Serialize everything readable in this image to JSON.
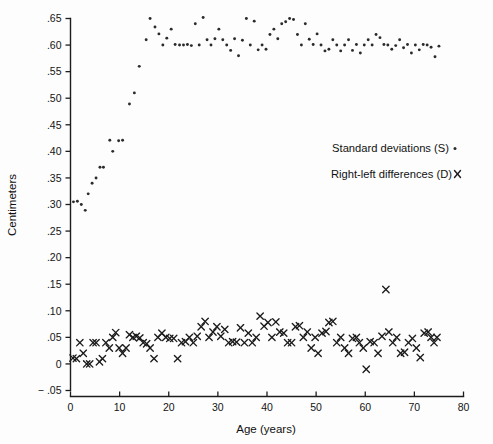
{
  "chart_data": {
    "type": "scatter",
    "title": "",
    "xlabel": "Age (years)",
    "ylabel": "Centimeters",
    "xlim": [
      0,
      80
    ],
    "ylim": [
      -0.05,
      0.65
    ],
    "xticks": [
      0,
      10,
      20,
      30,
      40,
      50,
      60,
      70,
      80
    ],
    "xtick_labels": [
      "0",
      "10",
      "20",
      "30",
      "40",
      "50",
      "60",
      "70",
      "80"
    ],
    "yticks": [
      -0.05,
      0,
      0.05,
      0.1,
      0.15,
      0.2,
      0.25,
      0.3,
      0.35,
      0.4,
      0.45,
      0.5,
      0.55,
      0.6,
      0.65
    ],
    "ytick_labels": [
      "− .05",
      "0",
      ".05",
      ".10",
      ".15",
      ".20",
      ".25",
      ".30",
      ".35",
      ".40",
      ".45",
      ".50",
      ".55",
      ".60",
      ".65"
    ],
    "grid": false,
    "legend_position": "center-right",
    "legend": [
      {
        "label": "Standard deviations (S)",
        "marker": "dot",
        "series": "S"
      },
      {
        "label": "Right-left differences (D)",
        "marker": "x",
        "series": "D"
      }
    ],
    "series": [
      {
        "name": "Standard deviations (S)",
        "key": "S",
        "marker": "dot",
        "color": "#2b2b2b",
        "points": [
          [
            0.6,
            0.305
          ],
          [
            1.4,
            0.306
          ],
          [
            2.2,
            0.3
          ],
          [
            3.0,
            0.289
          ],
          [
            3.6,
            0.32
          ],
          [
            4.4,
            0.34
          ],
          [
            5.2,
            0.35
          ],
          [
            6.0,
            0.37
          ],
          [
            6.7,
            0.37
          ],
          [
            8.0,
            0.421
          ],
          [
            8.6,
            0.4
          ],
          [
            9.8,
            0.42
          ],
          [
            10.6,
            0.421
          ],
          [
            12.0,
            0.489
          ],
          [
            13.0,
            0.51
          ],
          [
            14.0,
            0.56
          ],
          [
            15.4,
            0.61
          ],
          [
            16.2,
            0.65
          ],
          [
            17.2,
            0.634
          ],
          [
            18.0,
            0.621
          ],
          [
            18.8,
            0.6
          ],
          [
            19.6,
            0.613
          ],
          [
            20.5,
            0.63
          ],
          [
            21.3,
            0.601
          ],
          [
            22.2,
            0.6
          ],
          [
            23.0,
            0.6
          ],
          [
            23.8,
            0.601
          ],
          [
            24.6,
            0.599
          ],
          [
            25.4,
            0.64
          ],
          [
            26.2,
            0.6
          ],
          [
            27.0,
            0.652
          ],
          [
            27.8,
            0.61
          ],
          [
            28.6,
            0.6
          ],
          [
            29.4,
            0.612
          ],
          [
            30.2,
            0.63
          ],
          [
            31.0,
            0.61
          ],
          [
            31.8,
            0.6
          ],
          [
            32.6,
            0.59
          ],
          [
            33.4,
            0.612
          ],
          [
            34.2,
            0.58
          ],
          [
            35.0,
            0.609
          ],
          [
            35.8,
            0.65
          ],
          [
            36.6,
            0.6
          ],
          [
            37.4,
            0.645
          ],
          [
            38.2,
            0.591
          ],
          [
            39.0,
            0.6
          ],
          [
            39.8,
            0.592
          ],
          [
            40.6,
            0.62
          ],
          [
            41.4,
            0.63
          ],
          [
            42.2,
            0.612
          ],
          [
            43.0,
            0.64
          ],
          [
            43.8,
            0.644
          ],
          [
            44.6,
            0.65
          ],
          [
            45.4,
            0.648
          ],
          [
            46.2,
            0.62
          ],
          [
            47.0,
            0.6
          ],
          [
            47.8,
            0.64
          ],
          [
            48.6,
            0.611
          ],
          [
            49.4,
            0.601
          ],
          [
            50.2,
            0.621
          ],
          [
            51.0,
            0.6
          ],
          [
            51.8,
            0.589
          ],
          [
            52.6,
            0.592
          ],
          [
            53.4,
            0.61
          ],
          [
            54.2,
            0.6
          ],
          [
            55.0,
            0.589
          ],
          [
            55.8,
            0.6
          ],
          [
            56.6,
            0.61
          ],
          [
            57.4,
            0.59
          ],
          [
            58.2,
            0.601
          ],
          [
            59.0,
            0.585
          ],
          [
            59.8,
            0.6
          ],
          [
            60.6,
            0.61
          ],
          [
            61.4,
            0.6
          ],
          [
            62.2,
            0.62
          ],
          [
            63.0,
            0.614
          ],
          [
            63.8,
            0.601
          ],
          [
            64.6,
            0.6
          ],
          [
            65.4,
            0.592
          ],
          [
            66.2,
            0.599
          ],
          [
            67.0,
            0.61
          ],
          [
            67.8,
            0.595
          ],
          [
            68.6,
            0.601
          ],
          [
            69.4,
            0.585
          ],
          [
            70.2,
            0.6
          ],
          [
            71.0,
            0.591
          ],
          [
            71.8,
            0.601
          ],
          [
            72.6,
            0.6
          ],
          [
            73.4,
            0.596
          ],
          [
            74.2,
            0.578
          ],
          [
            75.0,
            0.598
          ]
        ]
      },
      {
        "name": "Right-left differences (D)",
        "key": "D",
        "marker": "x",
        "color": "#1b1b1b",
        "points": [
          [
            0.5,
            0.011
          ],
          [
            1.2,
            0.01
          ],
          [
            1.9,
            0.04
          ],
          [
            2.6,
            0.02
          ],
          [
            3.3,
            0.0
          ],
          [
            3.9,
            0.0
          ],
          [
            4.6,
            0.04
          ],
          [
            5.2,
            0.04
          ],
          [
            5.9,
            0.004
          ],
          [
            6.5,
            0.01
          ],
          [
            7.2,
            0.04
          ],
          [
            7.9,
            0.03
          ],
          [
            8.6,
            0.05
          ],
          [
            9.2,
            0.059
          ],
          [
            9.9,
            0.03
          ],
          [
            10.6,
            0.02
          ],
          [
            11.3,
            0.03
          ],
          [
            12.0,
            0.055
          ],
          [
            12.7,
            0.05
          ],
          [
            13.4,
            0.052
          ],
          [
            14.1,
            0.049
          ],
          [
            14.8,
            0.04
          ],
          [
            15.5,
            0.038
          ],
          [
            16.2,
            0.03
          ],
          [
            17.0,
            0.01
          ],
          [
            17.8,
            0.05
          ],
          [
            18.6,
            0.058
          ],
          [
            19.4,
            0.05
          ],
          [
            20.2,
            0.048
          ],
          [
            21.0,
            0.048
          ],
          [
            21.8,
            0.01
          ],
          [
            22.6,
            0.04
          ],
          [
            23.4,
            0.042
          ],
          [
            24.2,
            0.05
          ],
          [
            25.0,
            0.04
          ],
          [
            25.8,
            0.052
          ],
          [
            26.6,
            0.07
          ],
          [
            27.4,
            0.08
          ],
          [
            28.2,
            0.05
          ],
          [
            29.0,
            0.06
          ],
          [
            29.8,
            0.07
          ],
          [
            30.6,
            0.052
          ],
          [
            31.4,
            0.065
          ],
          [
            32.2,
            0.04
          ],
          [
            33.0,
            0.042
          ],
          [
            33.8,
            0.041
          ],
          [
            34.6,
            0.068
          ],
          [
            35.4,
            0.04
          ],
          [
            36.2,
            0.058
          ],
          [
            37.0,
            0.04
          ],
          [
            37.8,
            0.05
          ],
          [
            38.6,
            0.09
          ],
          [
            39.4,
            0.071
          ],
          [
            40.2,
            0.078
          ],
          [
            41.0,
            0.05
          ],
          [
            41.8,
            0.079
          ],
          [
            42.6,
            0.06
          ],
          [
            43.4,
            0.058
          ],
          [
            44.2,
            0.04
          ],
          [
            45.0,
            0.04
          ],
          [
            45.8,
            0.07
          ],
          [
            46.6,
            0.072
          ],
          [
            47.4,
            0.05
          ],
          [
            48.2,
            0.06
          ],
          [
            49.0,
            0.03
          ],
          [
            49.8,
            0.05
          ],
          [
            50.4,
            0.02
          ],
          [
            51.2,
            0.058
          ],
          [
            52.0,
            0.061
          ],
          [
            52.6,
            0.078
          ],
          [
            53.4,
            0.08
          ],
          [
            54.2,
            0.04
          ],
          [
            55.0,
            0.05
          ],
          [
            55.8,
            0.03
          ],
          [
            56.6,
            0.02
          ],
          [
            57.4,
            0.048
          ],
          [
            58.2,
            0.05
          ],
          [
            58.8,
            0.04
          ],
          [
            59.6,
            0.03
          ],
          [
            60.2,
            -0.01
          ],
          [
            61.0,
            0.042
          ],
          [
            61.8,
            0.04
          ],
          [
            62.6,
            0.02
          ],
          [
            63.4,
            0.052
          ],
          [
            64.2,
            0.14
          ],
          [
            64.8,
            0.06
          ],
          [
            65.6,
            0.04
          ],
          [
            66.4,
            0.05
          ],
          [
            67.2,
            0.02
          ],
          [
            68.0,
            0.022
          ],
          [
            68.8,
            0.04
          ],
          [
            69.6,
            0.048
          ],
          [
            70.4,
            0.03
          ],
          [
            71.2,
            0.012
          ],
          [
            72.0,
            0.058
          ],
          [
            72.8,
            0.06
          ],
          [
            73.4,
            0.05
          ],
          [
            74.0,
            0.04
          ],
          [
            74.6,
            0.05
          ]
        ]
      }
    ]
  }
}
